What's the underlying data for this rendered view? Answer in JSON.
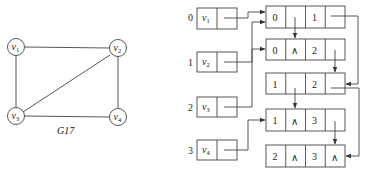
{
  "graph": {
    "caption": "G17",
    "vertices": [
      {
        "name": "v",
        "sub": "1"
      },
      {
        "name": "v",
        "sub": "2"
      },
      {
        "name": "v",
        "sub": "3"
      },
      {
        "name": "v",
        "sub": "4"
      }
    ],
    "edges": [
      [
        "v1",
        "v2"
      ],
      [
        "v1",
        "v3"
      ],
      [
        "v2",
        "v3"
      ],
      [
        "v2",
        "v4"
      ],
      [
        "v3",
        "v4"
      ]
    ]
  },
  "multilist": {
    "vertex_table": [
      {
        "index": "0",
        "name": "v",
        "sub": "1"
      },
      {
        "index": "1",
        "name": "v",
        "sub": "2"
      },
      {
        "index": "2",
        "name": "v",
        "sub": "3"
      },
      {
        "index": "3",
        "name": "v",
        "sub": "4"
      }
    ],
    "edge_nodes": [
      {
        "ivex": "0",
        "ilink": "",
        "jvex": "1",
        "jlink": ""
      },
      {
        "ivex": "0",
        "ilink": "∧",
        "jvex": "2",
        "jlink": ""
      },
      {
        "ivex": "1",
        "ilink": "",
        "jvex": "2",
        "jlink": ""
      },
      {
        "ivex": "1",
        "ilink": "∧",
        "jvex": "3",
        "jlink": ""
      },
      {
        "ivex": "2",
        "ilink": "∧",
        "jvex": "3",
        "jlink": "∧"
      }
    ],
    "null_symbol": "∧"
  }
}
